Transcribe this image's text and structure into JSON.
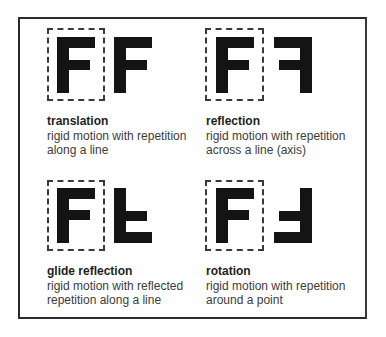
{
  "panels": [
    {
      "id": "translation",
      "title": "translation",
      "lines": [
        "rigid motion with repetition",
        "along a line"
      ],
      "transform": "none"
    },
    {
      "id": "reflection",
      "title": "reflection",
      "lines": [
        "rigid motion with repetition",
        "across a line (axis)"
      ],
      "transform": "mirror-horizontal"
    },
    {
      "id": "glide-reflection",
      "title": "glide reflection",
      "lines": [
        "rigid motion with reflected",
        "repetition along a line"
      ],
      "transform": "mirror-vertical"
    },
    {
      "id": "rotation",
      "title": "rotation",
      "lines": [
        "rigid motion with repetition",
        "around a point"
      ],
      "transform": "rotate-180"
    }
  ],
  "colors": {
    "glyph": "#141414",
    "border": "#2a2a2a",
    "text": "#3c3c3c"
  }
}
